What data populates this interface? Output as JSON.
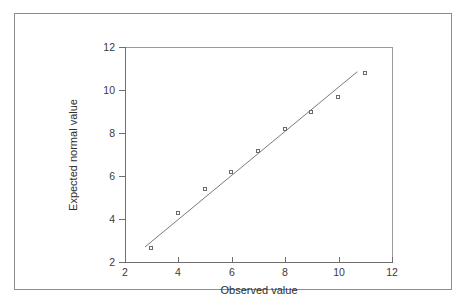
{
  "figure": {
    "background_color": "#ffffff",
    "frame_color": "#8d8d8d",
    "axis_color": "#6f6f6f",
    "marker_color": "#6b6b6b",
    "line_color": "#7a7a7a"
  },
  "chart_data": {
    "type": "scatter",
    "title": "",
    "xlabel": "Observed value",
    "ylabel": "Expected normal value",
    "xlim": [
      2,
      12
    ],
    "ylim": [
      2,
      12
    ],
    "xticks": [
      2,
      4,
      6,
      8,
      10,
      12
    ],
    "yticks": [
      2,
      4,
      6,
      8,
      10,
      12
    ],
    "xticklabels": [
      "2",
      "4",
      "6",
      "8",
      "10",
      "12"
    ],
    "yticklabels": [
      "2",
      "4",
      "6",
      "8",
      "10",
      "12"
    ],
    "grid": false,
    "legend": null,
    "series": [
      {
        "name": "Expected normal value",
        "marker": "open-square",
        "x": [
          3,
          4,
          5,
          6,
          7,
          8,
          9,
          10,
          11
        ],
        "y": [
          2.65,
          4.25,
          5.35,
          6.15,
          7.15,
          8.15,
          8.95,
          9.65,
          10.75
        ]
      }
    ],
    "reference_line": {
      "name": "normal-reference-line",
      "x": [
        2.75,
        10.7
      ],
      "y": [
        2.7,
        10.85
      ]
    }
  }
}
